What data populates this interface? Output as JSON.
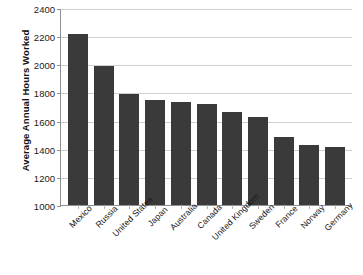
{
  "chart_data": {
    "type": "bar",
    "title": "",
    "xlabel": "",
    "ylabel": "Average Annual Hours Worked",
    "categories": [
      "Mexico",
      "Russia",
      "United States",
      "Japan",
      "Australia",
      "Canada",
      "United Kingdom",
      "Sweden",
      "France",
      "Norway",
      "Germany"
    ],
    "values": [
      2215,
      1985,
      1790,
      1745,
      1730,
      1715,
      1660,
      1625,
      1480,
      1430,
      1410
    ],
    "ylim": [
      1000,
      2400
    ],
    "ytick_step": 200,
    "yticks": [
      2400,
      2200,
      2000,
      1800,
      1600,
      1400,
      1200,
      1000
    ],
    "ytick_labels": [
      "2400",
      "2200",
      "2000",
      "1800",
      "1600",
      "1400",
      "1200",
      "1000"
    ],
    "grid": true,
    "legend": false,
    "bar_color": "#3a3a3a",
    "grid_color": "#cfcfcf",
    "axis_color": "#8f8f8f",
    "xtick_label_rotation": -45
  },
  "clipped_title": "",
  "axis": {
    "y_title": "Average Annual Hours Worked"
  }
}
